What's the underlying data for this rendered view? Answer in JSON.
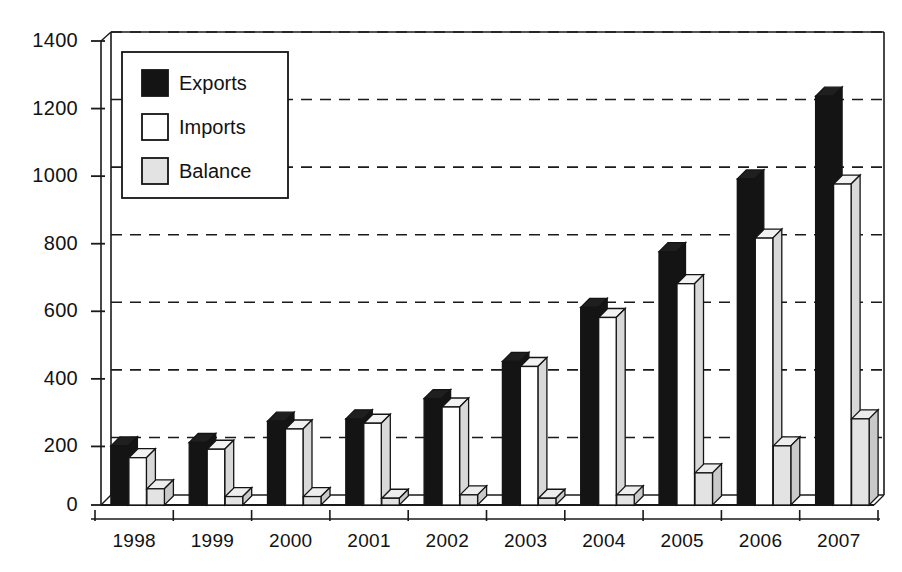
{
  "chart_data": {
    "type": "bar",
    "title": "",
    "subtitle": "",
    "xlabel": "",
    "ylabel": "",
    "categories": [
      "1998",
      "1999",
      "2000",
      "2001",
      "2002",
      "2003",
      "2004",
      "2005",
      "2006",
      "2007"
    ],
    "series": [
      {
        "name": "Exports",
        "color": "#141414",
        "values": [
          175,
          185,
          248,
          255,
          315,
          425,
          585,
          750,
          965,
          1210
        ]
      },
      {
        "name": "Imports",
        "color": "#ffffff",
        "values": [
          140,
          165,
          225,
          242,
          290,
          410,
          555,
          655,
          790,
          950
        ]
      },
      {
        "name": "Balance",
        "color": "#e3e3e3",
        "values": [
          48,
          25,
          25,
          20,
          30,
          20,
          30,
          95,
          175,
          255
        ]
      }
    ],
    "ylim": [
      0,
      1400
    ],
    "ytick_step": 200,
    "yticks": [
      "0",
      "200",
      "400",
      "600",
      "800",
      "1000",
      "1200",
      "1400"
    ],
    "grid": "horizontal-dashed",
    "legend_position": "top-left-inside",
    "legend_entries": [
      "Exports",
      "Imports",
      "Balance"
    ],
    "style": "3d-bars-monochrome"
  },
  "axes": {
    "y_axis_name": "y-axis",
    "x_axis_name": "x-axis"
  }
}
